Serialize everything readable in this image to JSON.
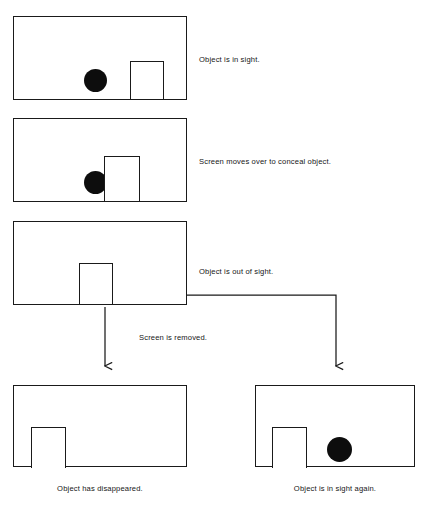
{
  "diagram": {
    "stroke_color": "#1a1a1a",
    "object_color": "#0d0d0d",
    "background_color": "#ffffff",
    "panels": [
      {
        "id": "panel-1",
        "caption": "Object is in sight.",
        "has_object": true,
        "object_visible": true,
        "screen_position": "right-of-object"
      },
      {
        "id": "panel-2",
        "caption": "Screen moves over to conceal object.",
        "has_object": true,
        "object_visible": false,
        "screen_position": "over-object"
      },
      {
        "id": "panel-3",
        "caption": "Object is out of sight.",
        "has_object": false,
        "object_visible": false,
        "screen_position": "center"
      },
      {
        "id": "panel-4",
        "caption": "Object has disappeared.",
        "has_object": false,
        "object_visible": false,
        "screen_position": "left"
      },
      {
        "id": "panel-5",
        "caption": "Object is in sight again.",
        "has_object": true,
        "object_visible": true,
        "screen_position": "left"
      }
    ],
    "transition_label": "Screen is removed.",
    "arrows": [
      {
        "id": "arrow-left",
        "from": "panel-3",
        "to": "panel-4",
        "shape": "straight-down"
      },
      {
        "id": "arrow-right",
        "from": "panel-3",
        "to": "panel-5",
        "shape": "elbow-right-down"
      }
    ]
  }
}
